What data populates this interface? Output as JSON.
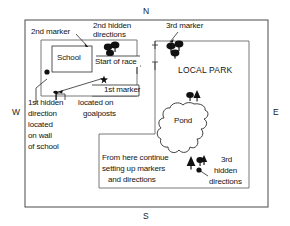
{
  "diagram": {
    "title_region": "orienteering race course sketch map",
    "compass": {
      "north": "N",
      "south": "S",
      "east": "E",
      "west": "W"
    },
    "labels": {
      "second_marker": "2nd marker",
      "second_hidden_directions_l1": "2nd hidden",
      "second_hidden_directions_l2": "directions",
      "third_marker": "3rd marker",
      "school": "School",
      "start_of_race": "Start of race",
      "local_park": "LOCAL PARK",
      "first_marker": "1st marker",
      "first_hidden_l1": "1st hidden",
      "first_hidden_l2": "direction",
      "first_hidden_l3": "located",
      "first_hidden_l4": "on wall",
      "first_hidden_l5": "of school",
      "located_on_l1": "located on",
      "located_on_l2": "goalposts",
      "pond": "Pond",
      "from_here_l1": "From here continue",
      "from_here_l2": "setting up markers",
      "from_here_l3": "and directions",
      "third_hidden_l1": "3rd",
      "third_hidden_l2": "hidden",
      "third_hidden_l3": "directions"
    },
    "symbols": {
      "marker_dot": "filled-circle-marker",
      "marker_star": "star-marker",
      "goalposts": "goalpost-symbol",
      "trees": "tree-cluster",
      "pond": "pond-outline"
    },
    "colors": {
      "ink": "#141414",
      "line": "#4a4a4a",
      "paper": "#ffffff"
    }
  }
}
